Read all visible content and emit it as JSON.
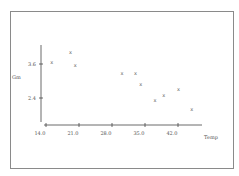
{
  "chart_data": {
    "type": "scatter",
    "title": "",
    "xlabel": "Temp",
    "ylabel": "Gm",
    "x_ticks": [
      "14.0",
      "21.0",
      "28.0",
      "35.0",
      "42.0"
    ],
    "y_ticks": [
      "3.6",
      "2.4"
    ],
    "xlim": [
      14.0,
      47.0
    ],
    "ylim": [
      1.9,
      4.3
    ],
    "grid": false,
    "legend": null,
    "marker": "x",
    "series": [
      {
        "name": "Gm vs Temp",
        "points": [
          {
            "x": 15.2,
            "y": 3.65
          },
          {
            "x": 19.2,
            "y": 4.03
          },
          {
            "x": 20.2,
            "y": 3.56
          },
          {
            "x": 30.1,
            "y": 3.26
          },
          {
            "x": 33.0,
            "y": 3.26
          },
          {
            "x": 34.1,
            "y": 2.9
          },
          {
            "x": 37.1,
            "y": 2.34
          },
          {
            "x": 39.0,
            "y": 2.49
          },
          {
            "x": 42.1,
            "y": 2.72
          },
          {
            "x": 44.9,
            "y": 2.02
          }
        ]
      }
    ]
  },
  "colors": {
    "axis": "#444444",
    "frame": "#8a8a8a",
    "marker": "#666666"
  }
}
